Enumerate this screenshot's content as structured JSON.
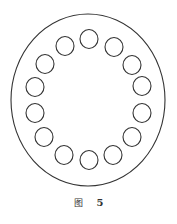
{
  "figure": {
    "caption_label": "图",
    "caption_number": "5",
    "stroke_color": "#333333",
    "outer_ellipse": {
      "cx": 88,
      "cy": 100,
      "rx": 77,
      "ry": 86
    },
    "holes": [
      {
        "cx": 89,
        "cy": 39
      },
      {
        "cx": 114,
        "cy": 47
      },
      {
        "cx": 132,
        "cy": 65
      },
      {
        "cx": 142,
        "cy": 86
      },
      {
        "cx": 142,
        "cy": 113
      },
      {
        "cx": 132,
        "cy": 137
      },
      {
        "cx": 113,
        "cy": 155
      },
      {
        "cx": 89,
        "cy": 160
      },
      {
        "cx": 64,
        "cy": 155
      },
      {
        "cx": 44,
        "cy": 137
      },
      {
        "cx": 35,
        "cy": 113
      },
      {
        "cx": 35,
        "cy": 87
      },
      {
        "cx": 45,
        "cy": 64
      },
      {
        "cx": 65,
        "cy": 46
      }
    ],
    "hole_rx": 9,
    "hole_ry": 9.5,
    "hole_count": 14
  }
}
